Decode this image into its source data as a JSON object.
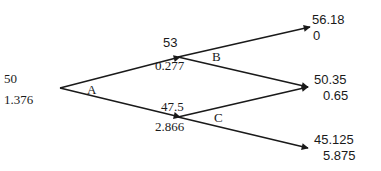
{
  "tree": {
    "root": {
      "value": "50",
      "sub": "1.376"
    },
    "up": {
      "value": "53",
      "sub": "0.277"
    },
    "down": {
      "value": "47.5",
      "sub": "2.866"
    },
    "uu": {
      "value": "56.18",
      "sub": "0"
    },
    "ud": {
      "value": "50.35",
      "sub": "0.65"
    },
    "dd": {
      "value": "45.125",
      "sub": "5.875"
    },
    "node_labels": {
      "a": "A",
      "b": "B",
      "c": "C"
    }
  },
  "colors": {
    "line": "#1a1a1a",
    "background": "#ffffff"
  }
}
